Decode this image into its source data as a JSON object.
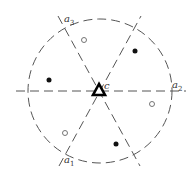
{
  "diagram": {
    "type": "symmetry-diagram",
    "circle": {
      "cx": 100,
      "cy": 91,
      "r": 72,
      "style": "dashed",
      "color": "#444444"
    },
    "center_symbol": {
      "shape": "triangle",
      "label": "c",
      "x": 99,
      "y": 91
    },
    "axes": [
      {
        "name": "a1",
        "label": "a",
        "subscript": "1",
        "x1": 59,
        "y1": 166,
        "x2": 141,
        "y2": 16,
        "label_x": 63,
        "label_y": 164
      },
      {
        "name": "a2",
        "label": "a",
        "subscript": "2",
        "x1": 16,
        "y1": 91,
        "x2": 186,
        "y2": 91,
        "label_x": 173,
        "label_y": 88
      },
      {
        "name": "a3",
        "label": "a",
        "subscript": "3",
        "x1": 58,
        "y1": 16,
        "x2": 140,
        "y2": 166,
        "label_x": 64,
        "label_y": 22
      }
    ],
    "filled_points": [
      {
        "x": 49,
        "y": 80
      },
      {
        "x": 135,
        "y": 51
      },
      {
        "x": 116,
        "y": 144
      }
    ],
    "open_points": [
      {
        "x": 84,
        "y": 40
      },
      {
        "x": 152,
        "y": 104
      },
      {
        "x": 65,
        "y": 133
      }
    ],
    "colors": {
      "line": "#555555",
      "point": "#111111",
      "open_point_stroke": "#666666",
      "triangle": "#000000"
    }
  }
}
